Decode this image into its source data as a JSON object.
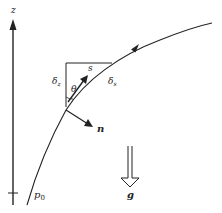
{
  "diagram": {
    "axis": {
      "label": "z"
    },
    "curve": {
      "start_label": "p",
      "start_subscript": "0"
    },
    "triangle": {
      "vertical_label": "δ",
      "vertical_subscript": "z",
      "hypotenuse_label": "δ",
      "hypotenuse_subscript": "s",
      "angle_label": "θ"
    },
    "tangent_vector": {
      "label": "s"
    },
    "normal_vector": {
      "label": "n"
    },
    "gravity": {
      "label": "g"
    },
    "colors": {
      "stroke": "#222222",
      "background": "#ffffff"
    }
  }
}
